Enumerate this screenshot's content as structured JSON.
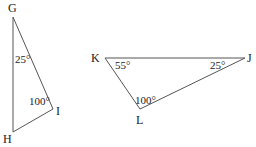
{
  "triangles": [
    {
      "name": "GHI",
      "vertices": {
        "G": "G",
        "H": "H",
        "I": "I"
      },
      "angles": {
        "G": "25°",
        "I": "100°"
      }
    },
    {
      "name": "KJL",
      "vertices": {
        "K": "K",
        "J": "J",
        "L": "L"
      },
      "angles": {
        "K": "55°",
        "J": "25°",
        "L": "100°"
      }
    }
  ],
  "colors": {
    "line": "#555555",
    "text": "#222222"
  }
}
